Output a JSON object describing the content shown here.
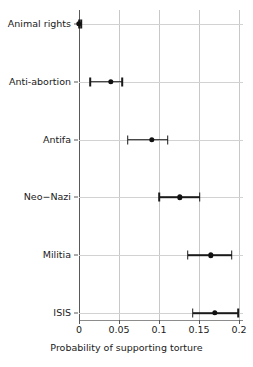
{
  "chart_data": {
    "type": "scatter",
    "title": "",
    "subtitle": "",
    "xlabel": "Probability of supporting torture",
    "ylabel": "",
    "xlim": [
      0,
      0.205
    ],
    "xticks": [
      0,
      0.05,
      0.1,
      0.15,
      0.2
    ],
    "xticklabels": [
      "0",
      "0.05",
      "0.1",
      "0.15",
      "0.2"
    ],
    "categories": [
      "Animal rights",
      "Anti-abortion",
      "Antifa",
      "Neo−Nazi",
      "Militia",
      "ISIS"
    ],
    "values": [
      0.0,
      0.04,
      0.091,
      0.126,
      0.165,
      0.17
    ],
    "ci_low": [
      0.0,
      0.014,
      0.061,
      0.1,
      0.136,
      0.142
    ],
    "ci_high": [
      0.003,
      0.054,
      0.111,
      0.151,
      0.191,
      0.199
    ],
    "grid": "vertical",
    "legend": "none",
    "orientation": "horizontal",
    "error_bars": true,
    "marker": "filled-circle",
    "colors": {
      "marker": "#111111",
      "error_bar": "#1a1a1a",
      "gridline": "#c8c8c8",
      "axis": "#595959",
      "background": "#ffffff",
      "text": "#1a1a1a"
    }
  }
}
